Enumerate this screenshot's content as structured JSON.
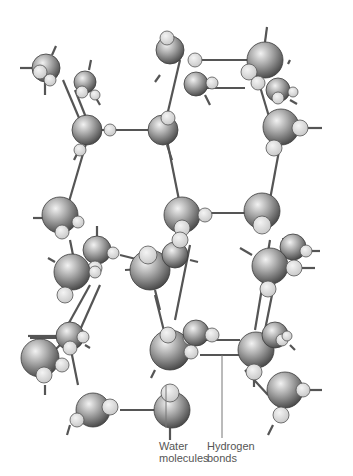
{
  "diagram": {
    "colors": {
      "oxygen_light": "#e6e6e6",
      "oxygen_dark": "#5a5a5a",
      "hydrogen": "#e2e2e2",
      "bond": "#555555",
      "leader": "#777777",
      "text": "#555555"
    },
    "labels": {
      "water": {
        "line1": "Water",
        "line2": "molecules",
        "x": 159,
        "y": 440,
        "leader": [
          [
            166,
            428
          ],
          [
            166,
            385
          ]
        ]
      },
      "hydrogen": {
        "line1": "Hydrogen",
        "line2": "bonds",
        "x": 207,
        "y": 440,
        "leader": [
          [
            222,
            438
          ],
          [
            222,
            355
          ]
        ]
      }
    },
    "bonds": [
      [
        [
          92,
          130
        ],
        [
          160,
          130
        ]
      ],
      [
        [
          75,
          90
        ],
        [
          87,
          120
        ]
      ],
      [
        [
          63,
          80
        ],
        [
          82,
          125
        ]
      ],
      [
        [
          165,
          130
        ],
        [
          180,
          205
        ]
      ],
      [
        [
          180,
          60
        ],
        [
          166,
          120
        ]
      ],
      [
        [
          190,
          60
        ],
        [
          260,
          60
        ]
      ],
      [
        [
          200,
          88
        ],
        [
          245,
          88
        ]
      ],
      [
        [
          255,
          70
        ],
        [
          270,
          120
        ]
      ],
      [
        [
          282,
          135
        ],
        [
          268,
          210
        ]
      ],
      [
        [
          90,
          130
        ],
        [
          68,
          205
        ]
      ],
      [
        [
          210,
          213
        ],
        [
          260,
          213
        ]
      ],
      [
        [
          160,
          255
        ],
        [
          130,
          270
        ]
      ],
      [
        [
          120,
          255
        ],
        [
          140,
          260
        ]
      ],
      [
        [
          125,
          270
        ],
        [
          160,
          268
        ]
      ],
      [
        [
          70,
          240
        ],
        [
          75,
          265
        ]
      ],
      [
        [
          85,
          250
        ],
        [
          95,
          265
        ]
      ],
      [
        [
          190,
          245
        ],
        [
          175,
          320
        ]
      ],
      [
        [
          155,
          295
        ],
        [
          170,
          355
        ]
      ],
      [
        [
          270,
          240
        ],
        [
          255,
          330
        ]
      ],
      [
        [
          280,
          255
        ],
        [
          265,
          330
        ]
      ],
      [
        [
          90,
          285
        ],
        [
          65,
          330
        ]
      ],
      [
        [
          100,
          285
        ],
        [
          80,
          330
        ]
      ],
      [
        [
          70,
          345
        ],
        [
          78,
          385
        ]
      ],
      [
        [
          120,
          410
        ],
        [
          165,
          410
        ]
      ],
      [
        [
          200,
          340
        ],
        [
          240,
          340
        ]
      ],
      [
        [
          200,
          355
        ],
        [
          240,
          355
        ]
      ],
      [
        [
          30,
          338
        ],
        [
          70,
          338
        ]
      ],
      [
        [
          245,
          370
        ],
        [
          268,
          395
        ]
      ],
      [
        [
          65,
          340
        ],
        [
          45,
          360
        ]
      ]
    ],
    "molecules": [
      {
        "o": [
          46,
          68,
          14
        ],
        "h": [
          [
            40,
            72,
            7
          ],
          [
            50,
            80,
            6
          ]
        ],
        "stubs": [
          [
            [
              20,
              68
            ],
            [
              32,
              68
            ]
          ],
          [
            [
              52,
              55
            ],
            [
              56,
              46
            ]
          ],
          [
            [
              45,
              82
            ],
            [
              45,
              95
            ]
          ]
        ]
      },
      {
        "o": [
          85,
          82,
          11
        ],
        "h": [
          [
            82,
            92,
            6
          ],
          [
            95,
            95,
            5
          ]
        ],
        "stubs": [
          [
            [
              89,
              70
            ],
            [
              91,
              60
            ]
          ],
          [
            [
              96,
              98
            ],
            [
              100,
              105
            ]
          ]
        ]
      },
      {
        "o": [
          87,
          130,
          15
        ],
        "h": [
          [
            110,
            130,
            6
          ],
          [
            80,
            150,
            6
          ]
        ],
        "stubs": [
          [
            [
              78,
              152
            ],
            [
              74,
              160
            ]
          ]
        ]
      },
      {
        "o": [
          163,
          130,
          15
        ],
        "h": [
          [
            168,
            118,
            7
          ]
        ],
        "stubs": [
          [
            [
              167,
              145
            ],
            [
              172,
              160
            ]
          ]
        ]
      },
      {
        "o": [
          170,
          50,
          14
        ],
        "h": [
          [
            167,
            38,
            7
          ],
          [
            195,
            60,
            7
          ]
        ],
        "stubs": [
          [
            [
              160,
              75
            ],
            [
              155,
              82
            ]
          ]
        ]
      },
      {
        "o": [
          196,
          84,
          12
        ],
        "h": [
          [
            212,
            83,
            6
          ]
        ],
        "stubs": [
          [
            [
              205,
              95
            ],
            [
              210,
              105
            ]
          ]
        ]
      },
      {
        "o": [
          265,
          60,
          18
        ],
        "h": [
          [
            249,
            72,
            8
          ],
          [
            258,
            83,
            7
          ]
        ],
        "stubs": [
          [
            [
              265,
              42
            ],
            [
              267,
              27
            ]
          ]
        ]
      },
      {
        "o": [
          278,
          90,
          12
        ],
        "h": [
          [
            278,
            98,
            6
          ],
          [
            293,
            92,
            5
          ]
        ],
        "stubs": [
          [
            [
              288,
              64
            ],
            [
              290,
              60
            ]
          ],
          [
            [
              290,
              100
            ],
            [
              297,
              104
            ]
          ]
        ]
      },
      {
        "o": [
          281,
          127,
          18
        ],
        "h": [
          [
            300,
            128,
            8
          ],
          [
            274,
            148,
            8
          ]
        ],
        "stubs": [
          [
            [
              308,
              128
            ],
            [
              322,
              128
            ]
          ]
        ]
      },
      {
        "o": [
          60,
          215,
          18
        ],
        "h": [
          [
            62,
            232,
            7
          ],
          [
            78,
            222,
            6
          ]
        ],
        "stubs": [
          [
            [
              33,
              218
            ],
            [
              45,
              218
            ]
          ]
        ]
      },
      {
        "o": [
          97,
          250,
          14
        ],
        "h": [
          [
            113,
            253,
            6
          ],
          [
            95,
            268,
            7
          ]
        ],
        "stubs": [
          [
            [
              97,
              226
            ],
            [
              97,
              236
            ]
          ]
        ]
      },
      {
        "o": [
          72,
          272,
          18
        ],
        "h": [
          [
            65,
            295,
            8
          ],
          [
            95,
            272,
            6
          ]
        ],
        "stubs": [
          [
            [
              48,
              258
            ],
            [
              55,
              262
            ]
          ]
        ]
      },
      {
        "o": [
          150,
          270,
          20
        ],
        "h": [
          [
            148,
            255,
            9
          ]
        ],
        "stubs": [
          [
            [
              155,
              290
            ],
            [
              160,
              310
            ]
          ]
        ]
      },
      {
        "o": [
          182,
          215,
          18
        ],
        "h": [
          [
            182,
            228,
            8
          ],
          [
            205,
            215,
            7
          ]
        ],
        "stubs": []
      },
      {
        "o": [
          175,
          255,
          13
        ],
        "h": [
          [
            180,
            240,
            8
          ]
        ],
        "stubs": [
          [
            [
              190,
              260
            ],
            [
              198,
              262
            ]
          ]
        ]
      },
      {
        "o": [
          262,
          211,
          18
        ],
        "h": [
          [
            262,
            225,
            9
          ]
        ],
        "stubs": [
          [
            [
              285,
              250
            ],
            [
              283,
              238
            ]
          ]
        ]
      },
      {
        "o": [
          293,
          247,
          13
        ],
        "h": [
          [
            306,
            251,
            6
          ]
        ],
        "stubs": [
          [
            [
              310,
              251
            ],
            [
              320,
              251
            ]
          ]
        ]
      },
      {
        "o": [
          270,
          266,
          18
        ],
        "h": [
          [
            294,
            268,
            8
          ],
          [
            268,
            289,
            8
          ]
        ],
        "stubs": [
          [
            [
              240,
              248
            ],
            [
              252,
              255
            ]
          ],
          [
            [
              302,
              268
            ],
            [
              315,
              268
            ]
          ]
        ]
      },
      {
        "o": [
          40,
          358,
          19
        ],
        "h": [
          [
            44,
            375,
            8
          ],
          [
            62,
            365,
            7
          ]
        ],
        "stubs": [
          [
            [
              45,
              385
            ],
            [
              45,
              395
            ]
          ],
          [
            [
              28,
              336
            ],
            [
              60,
              336
            ]
          ]
        ]
      },
      {
        "o": [
          70,
          336,
          14
        ],
        "h": [
          [
            70,
            348,
            7
          ],
          [
            83,
            337,
            6
          ]
        ],
        "stubs": [
          [
            [
              85,
              345
            ],
            [
              90,
              348
            ]
          ]
        ]
      },
      {
        "o": [
          93,
          410,
          17
        ],
        "h": [
          [
            110,
            407,
            8
          ],
          [
            77,
            420,
            7
          ]
        ],
        "stubs": [
          [
            [
              70,
              425
            ],
            [
              67,
              435
            ]
          ]
        ]
      },
      {
        "o": [
          170,
          350,
          20
        ],
        "h": [
          [
            168,
            335,
            8
          ],
          [
            190,
            338,
            7
          ]
        ],
        "stubs": [
          [
            [
              155,
              370
            ],
            [
              151,
              378
            ]
          ]
        ]
      },
      {
        "o": [
          172,
          410,
          18
        ],
        "h": [
          [
            170,
            393,
            9
          ]
        ],
        "stubs": [
          [
            [
              170,
              428
            ],
            [
              170,
              440
            ]
          ]
        ]
      },
      {
        "o": [
          196,
          333,
          13
        ],
        "h": [
          [
            212,
            335,
            7
          ],
          [
            191,
            352,
            7
          ]
        ],
        "stubs": []
      },
      {
        "o": [
          256,
          350,
          18
        ],
        "h": [
          [
            254,
            372,
            8
          ]
        ],
        "stubs": [
          [
            [
              254,
              380
            ],
            [
              254,
              387
            ]
          ]
        ]
      },
      {
        "o": [
          275,
          335,
          13
        ],
        "h": [
          [
            282,
            340,
            6
          ],
          [
            287,
            336,
            5
          ]
        ],
        "stubs": [
          [
            [
              290,
              345
            ],
            [
              295,
              350
            ]
          ]
        ]
      },
      {
        "o": [
          285,
          390,
          18
        ],
        "h": [
          [
            303,
            390,
            7
          ],
          [
            281,
            415,
            8
          ]
        ],
        "stubs": [
          [
            [
              310,
              390
            ],
            [
              322,
              390
            ]
          ],
          [
            [
              273,
              425
            ],
            [
              268,
              435
            ]
          ]
        ]
      }
    ]
  }
}
